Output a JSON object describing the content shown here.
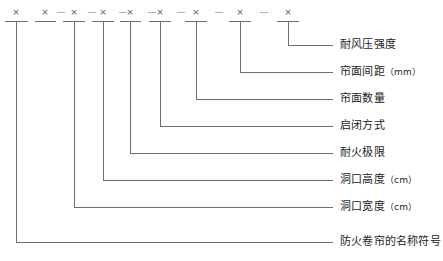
{
  "figure": {
    "type": "model-designation-breakdown",
    "subject": "防火卷帘",
    "symbol_row": {
      "cross": "×",
      "dash": "—",
      "sequence": [
        "×",
        "—",
        "×",
        "×",
        "—",
        "×",
        "—",
        "×",
        "—",
        "×",
        "—",
        "×",
        "—",
        "×",
        "—",
        "×"
      ],
      "cross_count": 8
    },
    "line_color": "#6e6e6e",
    "text_color": "#1b1b1b",
    "items": [
      {
        "index": 1,
        "label": "耐风压强度",
        "unit": "",
        "stem_x": 288,
        "label_y": 45
      },
      {
        "index": 2,
        "label": "帘面间距",
        "unit": "（mm）",
        "stem_x": 240,
        "label_y": 72
      },
      {
        "index": 3,
        "label": "帘面数量",
        "unit": "",
        "stem_x": 196,
        "label_y": 99
      },
      {
        "index": 4,
        "label": "启闭方式",
        "unit": "",
        "stem_x": 160,
        "label_y": 126
      },
      {
        "index": 5,
        "label": "耐火极限",
        "unit": "",
        "stem_x": 130,
        "label_y": 153
      },
      {
        "index": 6,
        "label": "洞口高度",
        "unit": "（cm）",
        "stem_x": 103,
        "label_y": 180
      },
      {
        "index": 7,
        "label": "洞口宽度",
        "unit": "（cm）",
        "stem_x": 74,
        "label_y": 207
      },
      {
        "index": 8,
        "label": "防火卷帘的名称符号",
        "unit": "",
        "stem_x": 45,
        "label_y": 242
      }
    ]
  }
}
